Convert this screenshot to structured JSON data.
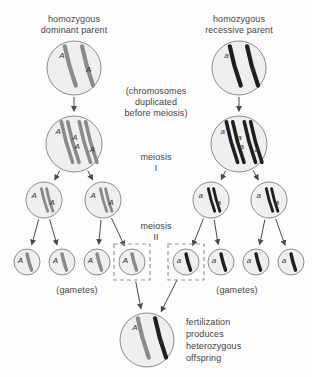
{
  "diagram": {
    "background_color": "#fdfdfd",
    "labels": {
      "parent_left": "homozygous\ndominant parent",
      "parent_right": "homozygous\nrecessive parent",
      "duplication_note": "(chromosomes\nduplicated\nbefore meiosis)",
      "meiosis_one": "meiosis\nI",
      "meiosis_two": "meiosis\nII",
      "gametes_left": "(gametes)",
      "gametes_right": "(gametes)",
      "fertilization_note": "fertilization\nproduces\nheterozygous\noffspring"
    },
    "alleles": {
      "dominant": "A",
      "recessive": "a"
    },
    "colors": {
      "cell_fill": "#efefef",
      "cell_stroke": "#8c8c8c",
      "chromosome_dominant": "#8a8a8a",
      "chromosome_recessive": "#1f1f1f",
      "arrow": "#4a4a4a",
      "dashed_box": "#9a9a9a",
      "text": "#444444"
    },
    "cells": [
      {
        "id": "parent-aa-dominant",
        "cx": 74,
        "cy": 68,
        "r": 27,
        "genotype": "AA",
        "allele_labels": [
          "A",
          "A"
        ],
        "chromosome_count": 2,
        "duplicated": false,
        "shade": "dominant"
      },
      {
        "id": "parent-aa-recessive",
        "cx": 239,
        "cy": 68,
        "r": 27,
        "genotype": "aa",
        "allele_labels": [
          "a",
          "a"
        ],
        "chromosome_count": 2,
        "duplicated": false,
        "shade": "recessive"
      },
      {
        "id": "duplicated-dominant",
        "cx": 74,
        "cy": 144,
        "r": 28,
        "genotype": "AA",
        "allele_labels": [
          "A",
          "A",
          "A",
          "A"
        ],
        "chromosome_count": 2,
        "duplicated": true,
        "shade": "dominant"
      },
      {
        "id": "duplicated-recessive",
        "cx": 239,
        "cy": 144,
        "r": 28,
        "genotype": "aa",
        "allele_labels": [
          "a",
          "a",
          "a",
          "a"
        ],
        "chromosome_count": 2,
        "duplicated": true,
        "shade": "recessive"
      },
      {
        "id": "meiosis1-dominant-left",
        "cx": 44,
        "cy": 200,
        "r": 18,
        "genotype": "A",
        "allele_labels": [
          "A",
          "A"
        ],
        "chromosome_count": 1,
        "duplicated": true,
        "shade": "dominant"
      },
      {
        "id": "meiosis1-dominant-right",
        "cx": 103,
        "cy": 200,
        "r": 18,
        "genotype": "A",
        "allele_labels": [
          "A",
          "A"
        ],
        "chromosome_count": 1,
        "duplicated": true,
        "shade": "dominant"
      },
      {
        "id": "meiosis1-recessive-left",
        "cx": 211,
        "cy": 200,
        "r": 18,
        "genotype": "a",
        "allele_labels": [
          "a",
          "a"
        ],
        "chromosome_count": 1,
        "duplicated": true,
        "shade": "recessive"
      },
      {
        "id": "meiosis1-recessive-right",
        "cx": 269,
        "cy": 200,
        "r": 18,
        "genotype": "a",
        "allele_labels": [
          "a",
          "a"
        ],
        "chromosome_count": 1,
        "duplicated": true,
        "shade": "recessive"
      },
      {
        "id": "gamete-a-1",
        "cx": 27,
        "cy": 262,
        "r": 13,
        "genotype": "A",
        "allele_labels": [
          "A"
        ],
        "chromosome_count": 1,
        "duplicated": false,
        "shade": "dominant",
        "boxed": false
      },
      {
        "id": "gamete-a-2",
        "cx": 62,
        "cy": 262,
        "r": 13,
        "genotype": "A",
        "allele_labels": [
          "A"
        ],
        "chromosome_count": 1,
        "duplicated": false,
        "shade": "dominant",
        "boxed": false
      },
      {
        "id": "gamete-a-3",
        "cx": 97,
        "cy": 262,
        "r": 13,
        "genotype": "A",
        "allele_labels": [
          "A"
        ],
        "chromosome_count": 1,
        "duplicated": false,
        "shade": "dominant",
        "boxed": false
      },
      {
        "id": "gamete-a-4",
        "cx": 132,
        "cy": 262,
        "r": 13,
        "genotype": "A",
        "allele_labels": [
          "A"
        ],
        "chromosome_count": 1,
        "duplicated": false,
        "shade": "dominant",
        "boxed": true
      },
      {
        "id": "gamete-r-1",
        "cx": 186,
        "cy": 262,
        "r": 13,
        "genotype": "a",
        "allele_labels": [
          "a"
        ],
        "chromosome_count": 1,
        "duplicated": false,
        "shade": "recessive",
        "boxed": true
      },
      {
        "id": "gamete-r-2",
        "cx": 221,
        "cy": 262,
        "r": 13,
        "genotype": "a",
        "allele_labels": [
          "a"
        ],
        "chromosome_count": 1,
        "duplicated": false,
        "shade": "recessive",
        "boxed": false
      },
      {
        "id": "gamete-r-3",
        "cx": 256,
        "cy": 262,
        "r": 13,
        "genotype": "a",
        "allele_labels": [
          "a"
        ],
        "chromosome_count": 1,
        "duplicated": false,
        "shade": "recessive",
        "boxed": false
      },
      {
        "id": "gamete-r-4",
        "cx": 291,
        "cy": 262,
        "r": 13,
        "genotype": "a",
        "allele_labels": [
          "a"
        ],
        "chromosome_count": 1,
        "duplicated": false,
        "shade": "recessive",
        "boxed": false
      },
      {
        "id": "zygote-heterozygous",
        "cx": 147,
        "cy": 340,
        "r": 27,
        "genotype": "Aa",
        "allele_labels": [
          "A",
          "a"
        ],
        "chromosome_count": 2,
        "duplicated": false,
        "shade": "mixed"
      }
    ]
  }
}
